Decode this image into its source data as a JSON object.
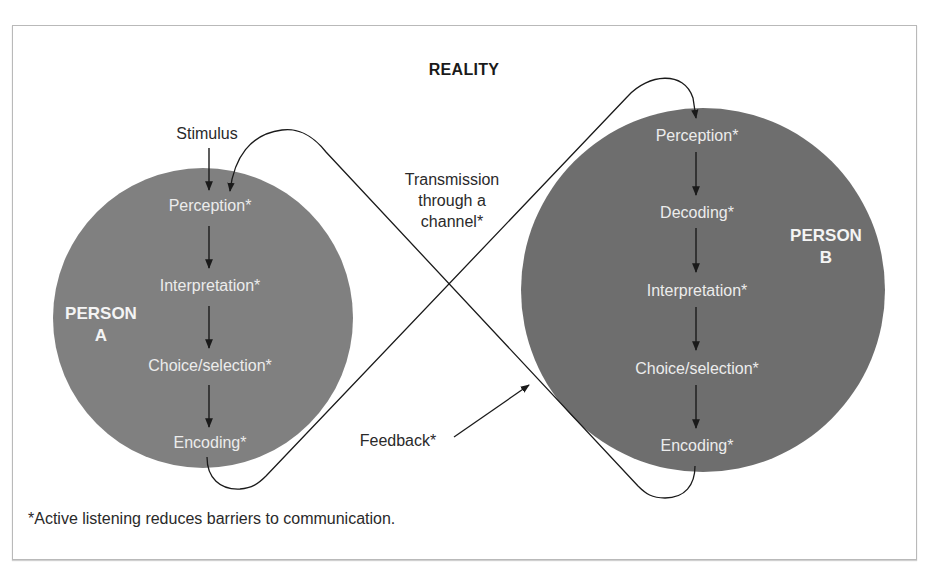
{
  "diagram": {
    "title": "REALITY",
    "person_a": {
      "label_line1": "PERSON",
      "label_line2": "A",
      "color": "#808080",
      "steps": [
        "Perception*",
        "Interpretation*",
        "Choice/selection*",
        "Encoding*"
      ]
    },
    "person_b": {
      "label_line1": "PERSON",
      "label_line2": "B",
      "color": "#6e6e6e",
      "steps": [
        "Perception*",
        "Decoding*",
        "Interpretation*",
        "Choice/selection*",
        "Encoding*"
      ]
    },
    "stimulus": "Stimulus",
    "transmission": {
      "line1": "Transmission",
      "line2": "through a",
      "line3": "channel*"
    },
    "feedback": "Feedback*",
    "footnote": "*Active listening reduces barriers to communication."
  }
}
